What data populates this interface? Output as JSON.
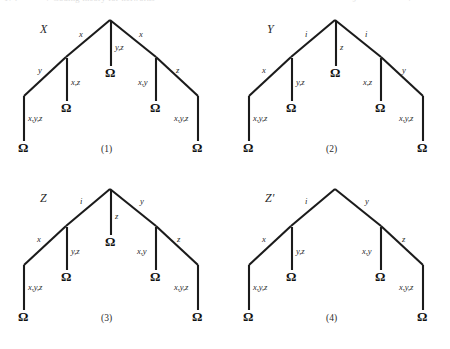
{
  "header": {
    "folio": "174",
    "title": "7  Coding theory for networks",
    "right_a": "§",
    "right_b": "7"
  },
  "figure": {
    "omega_glyph": "Ω",
    "ink_color": "#1b1b1b",
    "text_color": "#2b2b2b",
    "panels": [
      {
        "caption": "(1)",
        "name": "X",
        "apex_left": "x",
        "apex_center": "y,z",
        "apex_right": "x",
        "left_branch_diag": "y",
        "left_branch_stem": "x,z",
        "right_branch_stem": "x,y",
        "right_branch_diag": "z",
        "leaf_left": "x,y,z",
        "leaf_right": "x,y,z",
        "has_center_stem": true
      },
      {
        "caption": "(2)",
        "name": "Y",
        "apex_left": "i",
        "apex_center": "z",
        "apex_right": "i",
        "left_branch_diag": "x",
        "left_branch_stem": "y,z",
        "right_branch_stem": "x,z",
        "right_branch_diag": "y",
        "leaf_left": "x,y,z",
        "leaf_right": "x,y,z",
        "has_center_stem": true
      },
      {
        "caption": "(3)",
        "name": "Z",
        "apex_left": "i",
        "apex_center": "z",
        "apex_right": "y",
        "left_branch_diag": "x",
        "left_branch_stem": "y,z",
        "right_branch_stem": "x,y",
        "right_branch_diag": "z",
        "leaf_left": "x,y,z",
        "leaf_right": "x,y,z",
        "has_center_stem": true
      },
      {
        "caption": "(4)",
        "name": "Z′",
        "apex_left": "i",
        "apex_center": "",
        "apex_right": "y",
        "left_branch_diag": "x",
        "left_branch_stem": "y,z",
        "right_branch_stem": "x,y",
        "right_branch_diag": "z",
        "leaf_left": "x,y,z",
        "leaf_right": "x,y,z",
        "has_center_stem": false
      }
    ]
  }
}
